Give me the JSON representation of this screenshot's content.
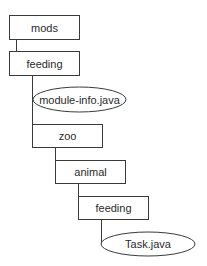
{
  "diagram": {
    "type": "directory-tree",
    "nodes": [
      {
        "id": "mods",
        "label": "mods",
        "kind": "folder",
        "x": 9,
        "y": 15,
        "w": 70,
        "h": 24
      },
      {
        "id": "feeding_module",
        "label": "feeding",
        "kind": "folder",
        "x": 9,
        "y": 51,
        "w": 70,
        "h": 24
      },
      {
        "id": "module_info",
        "label": "module-info.java",
        "kind": "file",
        "cx": 79.5,
        "cy": 99.5,
        "rx": 46.5,
        "ry": 12.5
      },
      {
        "id": "zoo",
        "label": "zoo",
        "kind": "folder",
        "x": 32,
        "y": 124,
        "w": 70,
        "h": 23
      },
      {
        "id": "animal",
        "label": "animal",
        "kind": "folder",
        "x": 55,
        "y": 160,
        "w": 70,
        "h": 23
      },
      {
        "id": "feeding_pkg",
        "label": "feeding",
        "kind": "folder",
        "x": 78,
        "y": 196,
        "w": 70,
        "h": 23
      },
      {
        "id": "task_java",
        "label": "Task.java",
        "kind": "file",
        "cx": 148,
        "cy": 244,
        "rx": 47,
        "ry": 12
      }
    ],
    "edges": [
      {
        "from": "mods",
        "to": "feeding_module"
      },
      {
        "from": "feeding_module",
        "to": "module_info"
      },
      {
        "from": "feeding_module",
        "to": "zoo"
      },
      {
        "from": "zoo",
        "to": "animal"
      },
      {
        "from": "animal",
        "to": "feeding_pkg"
      },
      {
        "from": "feeding_pkg",
        "to": "task_java"
      }
    ]
  },
  "labels": {
    "mods": "mods",
    "feeding_module": "feeding",
    "module_info": "module-info.java",
    "zoo": "zoo",
    "animal": "animal",
    "feeding_pkg": "feeding",
    "task_java": "Task.java"
  }
}
